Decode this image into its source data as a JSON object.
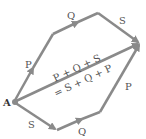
{
  "diagram": {
    "point_label": "A",
    "upper_path": [
      {
        "label": "P"
      },
      {
        "label": "Q"
      },
      {
        "label": "S"
      }
    ],
    "lower_path": [
      {
        "label": "S"
      },
      {
        "label": "Q"
      },
      {
        "label": "P"
      }
    ],
    "resultant_line1": "P + Q + S",
    "resultant_line2": "= S + Q + P",
    "colors": {
      "arrow": "#8a8a8a",
      "text": "#555555"
    }
  }
}
